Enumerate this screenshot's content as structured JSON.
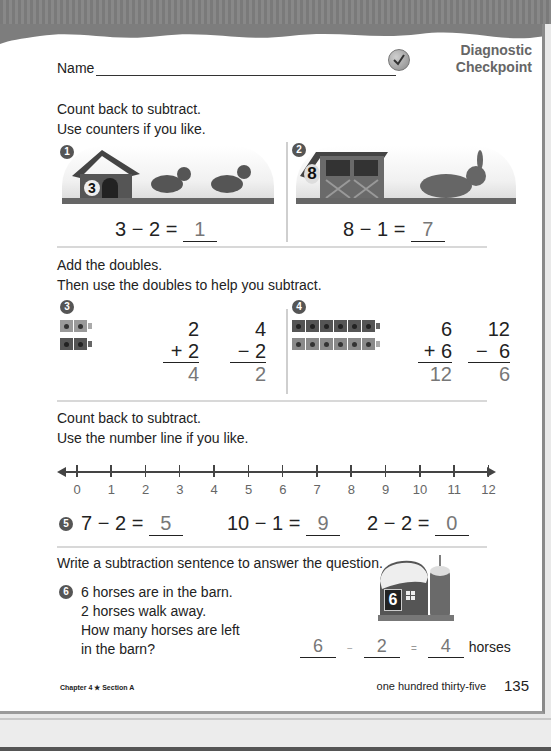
{
  "header": {
    "name_label": "Name",
    "badge_line1": "Diagnostic",
    "badge_line2": "Checkpoint"
  },
  "section1": {
    "instruction1": "Count back to subtract.",
    "instruction2": "Use counters if you like.",
    "problems": [
      {
        "number": "1",
        "scene_label": "3",
        "scene": "doghouse with dogs",
        "left": "3",
        "op": "−",
        "right": "2",
        "eq": "=",
        "answer": "1"
      },
      {
        "number": "2",
        "scene_label": "8",
        "scene": "rabbit hutch with rabbit",
        "left": "8",
        "op": "−",
        "right": "1",
        "eq": "=",
        "answer": "7"
      }
    ]
  },
  "section2": {
    "instruction1": "Add the doubles.",
    "instruction2": "Then use the doubles to help you subtract.",
    "problems": [
      {
        "number": "3",
        "cubes": 2,
        "add_top": "2",
        "add_op": "+",
        "add_bottom": "2",
        "add_answer": "4",
        "sub_top": "4",
        "sub_op": "−",
        "sub_bottom": "2",
        "sub_answer": "2"
      },
      {
        "number": "4",
        "cubes": 6,
        "add_top": "6",
        "add_op": "+",
        "add_bottom": "6",
        "add_answer": "12",
        "sub_top": "12",
        "sub_op": "−",
        "sub_bottom": "6",
        "sub_answer": "6"
      }
    ]
  },
  "section3": {
    "instruction1": "Count back to subtract.",
    "instruction2": "Use the number line if you like.",
    "number_line": [
      "0",
      "1",
      "2",
      "3",
      "4",
      "5",
      "6",
      "7",
      "8",
      "9",
      "10",
      "11",
      "12"
    ],
    "number": "5",
    "equations": [
      {
        "left": "7",
        "op": "−",
        "right": "2",
        "eq": "=",
        "answer": "5"
      },
      {
        "left": "10",
        "op": "−",
        "right": "1",
        "eq": "=",
        "answer": "9"
      },
      {
        "left": "2",
        "op": "−",
        "right": "2",
        "eq": "=",
        "answer": "0"
      }
    ]
  },
  "section4": {
    "instruction": "Write a subtraction sentence to answer the question.",
    "number": "6",
    "lines": [
      "6 horses are in the barn.",
      "2 horses walk away.",
      "How many horses are left",
      "in the barn?"
    ],
    "barn_label": "6",
    "answer_left": "6",
    "op": "−",
    "answer_right": "2",
    "eq": "=",
    "answer": "4",
    "unit": "horses"
  },
  "footer": {
    "chapter": "Chapter 4 ★ Section A",
    "page_words": "one hundred thirty-five",
    "page_number": "135"
  }
}
